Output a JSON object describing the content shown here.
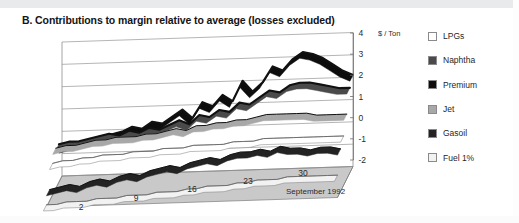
{
  "title": "B. Contributions to margin relative to average (losses excluded)",
  "axis": {
    "y_unit": "$ / Ton",
    "y_ticks": [
      "4",
      "3",
      "2",
      "1",
      "0",
      "-1",
      "-2"
    ],
    "x_ticks": [
      "2",
      "9",
      "16",
      "23",
      "30"
    ],
    "x_title": "September 1992"
  },
  "legend": {
    "items": [
      {
        "label": "LPGs",
        "color": "#ffffff"
      },
      {
        "label": "Naphtha",
        "color": "#4a4a4a"
      },
      {
        "label": "Premium",
        "color": "#0d0d0d"
      },
      {
        "label": "Jet",
        "color": "#a8a8a8"
      },
      {
        "label": "Gasoil",
        "color": "#232323"
      },
      {
        "label": "Fuel 1%",
        "color": "#f2f2f2"
      }
    ]
  },
  "chart_data": {
    "type": "line",
    "title": "B. Contributions to margin relative to average (losses excluded)",
    "xlabel": "September 1992",
    "ylabel": "$ / Ton",
    "ylim": [
      -2,
      4
    ],
    "grid": true,
    "legend_position": "right",
    "projection": "3d-ribbon",
    "x": [
      1,
      2,
      3,
      4,
      5,
      6,
      7,
      8,
      9,
      10,
      11,
      12,
      13,
      14,
      15,
      16,
      17,
      18,
      19,
      20,
      21,
      22,
      23,
      24,
      25,
      26,
      27,
      28,
      29,
      30
    ],
    "xtick_values": [
      2,
      9,
      16,
      23,
      30
    ],
    "series": [
      {
        "name": "Premium",
        "color": "#0d0d0d",
        "depth": 5,
        "values": [
          -0.7,
          -0.6,
          -0.5,
          -0.4,
          -0.3,
          -0.2,
          -0.1,
          0.1,
          0.0,
          0.3,
          0.2,
          0.5,
          0.8,
          0.4,
          1.1,
          0.9,
          1.4,
          1.1,
          2.0,
          1.5,
          1.9,
          2.6,
          2.4,
          2.9,
          3.2,
          3.1,
          2.9,
          2.6,
          2.3,
          2.1
        ]
      },
      {
        "name": "Naphtha",
        "color": "#4a4a4a",
        "depth": 4,
        "values": [
          -0.3,
          -0.2,
          -0.2,
          -0.1,
          0.0,
          0.1,
          0.0,
          0.2,
          0.1,
          0.3,
          0.2,
          0.4,
          0.6,
          0.4,
          0.8,
          0.7,
          1.0,
          0.9,
          1.3,
          1.2,
          1.5,
          1.8,
          1.7,
          2.0,
          2.1,
          2.1,
          2.0,
          1.9,
          1.8,
          1.8
        ]
      },
      {
        "name": "Jet",
        "color": "#a8a8a8",
        "depth": 3,
        "values": [
          -0.2,
          -0.1,
          -0.1,
          0.0,
          0.1,
          0.1,
          0.2,
          0.2,
          0.2,
          0.3,
          0.3,
          0.4,
          0.5,
          0.4,
          0.6,
          0.6,
          0.7,
          0.7,
          0.8,
          0.8,
          0.9,
          1.0,
          1.0,
          1.0,
          1.0,
          1.0,
          0.9,
          0.9,
          0.9,
          0.9
        ]
      },
      {
        "name": "LPGs",
        "color": "#ffffff",
        "depth": 2,
        "values": [
          -0.6,
          -0.5,
          -0.5,
          -0.4,
          -0.4,
          -0.3,
          -0.3,
          -0.3,
          -0.2,
          -0.2,
          -0.2,
          -0.1,
          -0.1,
          -0.1,
          0.0,
          0.0,
          0.0,
          0.0,
          0.1,
          0.1,
          0.1,
          0.2,
          0.2,
          0.2,
          0.2,
          0.2,
          0.2,
          0.2,
          0.2,
          0.2
        ]
      },
      {
        "name": "Gasoil",
        "color": "#232323",
        "depth": 1,
        "values": [
          -1.5,
          -1.4,
          -1.3,
          -1.4,
          -1.2,
          -1.1,
          -1.2,
          -1.0,
          -0.9,
          -1.0,
          -0.8,
          -0.7,
          -0.6,
          -0.7,
          -0.5,
          -0.4,
          -0.3,
          -0.4,
          -0.2,
          -0.1,
          -0.1,
          0.0,
          -0.1,
          0.1,
          0.0,
          0.0,
          -0.1,
          0.0,
          0.0,
          -0.1
        ]
      },
      {
        "name": "Fuel 1%",
        "color": "#f2f2f2",
        "depth": 0,
        "values": [
          -1.9,
          -1.9,
          -1.8,
          -1.8,
          -1.8,
          -1.7,
          -1.7,
          -1.7,
          -1.6,
          -1.6,
          -1.6,
          -1.5,
          -1.5,
          -1.5,
          -1.4,
          -1.4,
          -1.3,
          -1.3,
          -1.3,
          -1.2,
          -1.2,
          -1.1,
          -1.1,
          -1.1,
          -1.0,
          -1.0,
          -1.0,
          -1.0,
          -1.0,
          -1.0
        ]
      }
    ]
  }
}
